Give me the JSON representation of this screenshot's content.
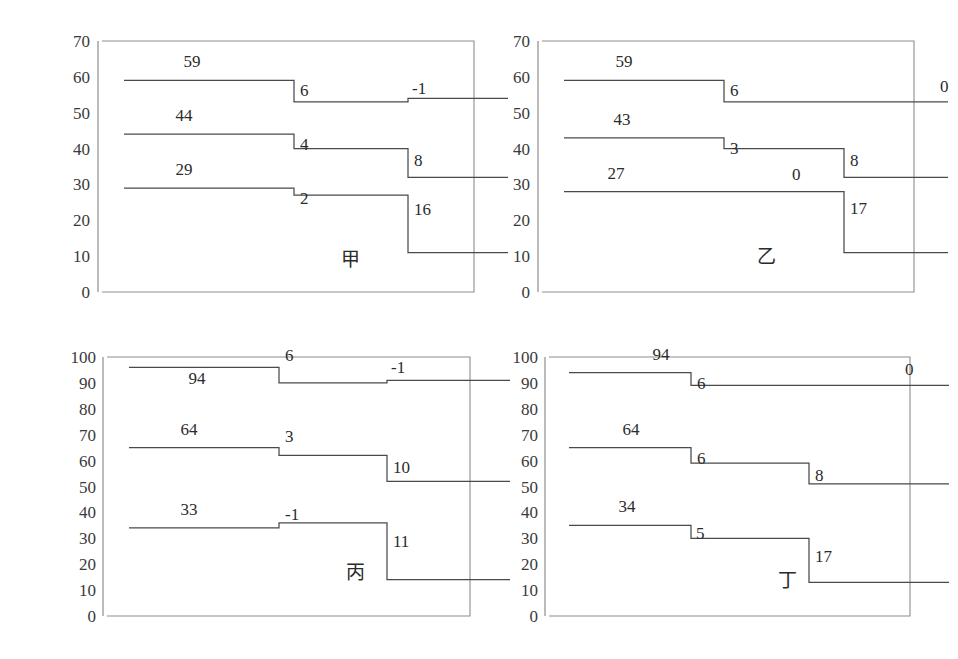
{
  "figure": {
    "background_color": "#ffffff",
    "line_color": "#4a4a4a",
    "frame_color": "#8d8d8d",
    "text_color": "#2b2b2b"
  },
  "chart_data": [
    {
      "type": "line",
      "subtype": "step",
      "title": "甲",
      "panel_position": "top-left",
      "xlabel": "",
      "ylabel": "",
      "ylim": [
        0,
        70
      ],
      "yticks": [
        0,
        10,
        20,
        30,
        40,
        50,
        60,
        70
      ],
      "ytick_labels": [
        "0",
        "10",
        "20",
        "30",
        "40",
        "50",
        "60",
        "70"
      ],
      "grid": false,
      "legend": "none",
      "x_breaks": [
        0,
        1,
        2,
        3
      ],
      "series": [
        {
          "name": "top",
          "start_label": "59",
          "values": [
            59,
            59,
            53,
            54
          ],
          "step_labels": [
            "6",
            "-1"
          ],
          "step_deltas": [
            6,
            -1
          ]
        },
        {
          "name": "middle",
          "start_label": "44",
          "values": [
            44,
            44,
            40,
            32
          ],
          "step_labels": [
            "4",
            "8"
          ],
          "step_deltas": [
            4,
            8
          ]
        },
        {
          "name": "bottom",
          "start_label": "29",
          "values": [
            29,
            29,
            27,
            11
          ],
          "step_labels": [
            "2",
            "16"
          ],
          "step_deltas": [
            2,
            16
          ]
        }
      ]
    },
    {
      "type": "line",
      "subtype": "step",
      "title": "乙",
      "panel_position": "top-right",
      "xlabel": "",
      "ylabel": "",
      "ylim": [
        0,
        70
      ],
      "yticks": [
        0,
        10,
        20,
        30,
        40,
        50,
        60,
        70
      ],
      "ytick_labels": [
        "0",
        "10",
        "20",
        "30",
        "40",
        "50",
        "60",
        "70"
      ],
      "grid": false,
      "legend": "none",
      "x_breaks": [
        0,
        1,
        2,
        3
      ],
      "series": [
        {
          "name": "top",
          "start_label": "59",
          "values": [
            59,
            59,
            53,
            53
          ],
          "step_labels": [
            "6",
            "0"
          ],
          "step_deltas": [
            6,
            0
          ]
        },
        {
          "name": "middle",
          "start_label": "43",
          "values": [
            43,
            43,
            40,
            32
          ],
          "step_labels": [
            "3",
            "8"
          ],
          "step_deltas": [
            3,
            8
          ]
        },
        {
          "name": "bottom",
          "start_label": "27",
          "values": [
            28,
            28,
            28,
            11
          ],
          "step_labels": [
            "0",
            "17"
          ],
          "step_deltas": [
            0,
            17
          ]
        }
      ]
    },
    {
      "type": "line",
      "subtype": "step",
      "title": "丙",
      "panel_position": "bottom-left",
      "xlabel": "",
      "ylabel": "",
      "ylim": [
        0,
        100
      ],
      "yticks": [
        0,
        10,
        20,
        30,
        40,
        50,
        60,
        70,
        80,
        90,
        100
      ],
      "ytick_labels": [
        "0",
        "10",
        "20",
        "30",
        "40",
        "50",
        "60",
        "70",
        "80",
        "90",
        "100"
      ],
      "grid": false,
      "legend": "none",
      "x_breaks": [
        0,
        1,
        2,
        3
      ],
      "series": [
        {
          "name": "top",
          "start_label": "94",
          "values": [
            96,
            96,
            90,
            91
          ],
          "step_labels": [
            "6",
            "-1"
          ],
          "step_deltas": [
            6,
            -1
          ]
        },
        {
          "name": "middle",
          "start_label": "64",
          "values": [
            65,
            65,
            62,
            52
          ],
          "step_labels": [
            "3",
            "10"
          ],
          "step_deltas": [
            3,
            10
          ]
        },
        {
          "name": "bottom",
          "start_label": "33",
          "values": [
            34,
            34,
            36,
            14
          ],
          "step_labels": [
            "-1",
            "11"
          ],
          "step_deltas": [
            -1,
            11
          ]
        }
      ]
    },
    {
      "type": "line",
      "subtype": "step",
      "title": "丁",
      "panel_position": "bottom-right",
      "xlabel": "",
      "ylabel": "",
      "ylim": [
        0,
        100
      ],
      "yticks": [
        0,
        10,
        20,
        30,
        40,
        50,
        60,
        70,
        80,
        90,
        100
      ],
      "ytick_labels": [
        "0",
        "10",
        "20",
        "30",
        "40",
        "50",
        "60",
        "70",
        "80",
        "90",
        "100"
      ],
      "grid": false,
      "legend": "none",
      "x_breaks": [
        0,
        1,
        2,
        3
      ],
      "series": [
        {
          "name": "top",
          "start_label": "94",
          "values": [
            94,
            94,
            89,
            89
          ],
          "step_labels": [
            "6",
            "0"
          ],
          "step_deltas": [
            6,
            0
          ]
        },
        {
          "name": "middle",
          "start_label": "64",
          "values": [
            65,
            65,
            59,
            51
          ],
          "step_labels": [
            "6",
            "8"
          ],
          "step_deltas": [
            6,
            8
          ]
        },
        {
          "name": "bottom",
          "start_label": "34",
          "values": [
            35,
            35,
            30,
            13
          ],
          "step_labels": [
            "5",
            "17"
          ],
          "step_deltas": [
            5,
            17
          ]
        }
      ]
    }
  ]
}
